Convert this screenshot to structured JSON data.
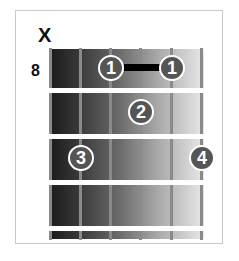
{
  "chord_diagram": {
    "strings": 6,
    "frets_shown": 4,
    "start_fret_label": "8",
    "muted_marker": "X",
    "muted_string": 1,
    "barre": {
      "finger": "1",
      "from_string": 3,
      "to_string": 5,
      "fret": 1
    },
    "fingers": [
      {
        "label": "1",
        "string": 3,
        "fret": 1
      },
      {
        "label": "1",
        "string": 5,
        "fret": 1
      },
      {
        "label": "2",
        "string": 4,
        "fret": 2
      },
      {
        "label": "3",
        "string": 2,
        "fret": 3
      },
      {
        "label": "4",
        "string": 6,
        "fret": 3
      }
    ]
  }
}
